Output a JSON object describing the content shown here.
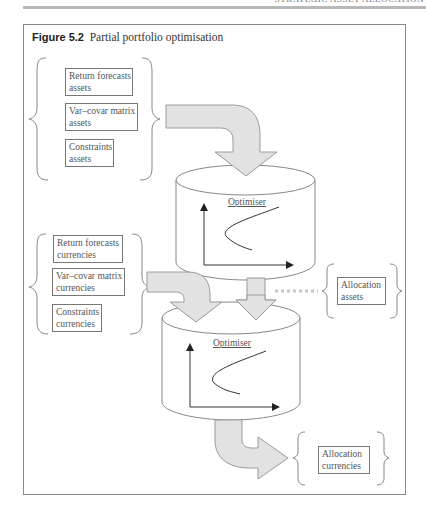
{
  "page": {
    "running_head": "STRATEGIC ASSET ALLOCATION"
  },
  "figure": {
    "number": "Figure 5.2",
    "title": "Partial portfolio optimisation"
  },
  "inputs_assets": [
    {
      "line1": "Return forecasts",
      "line2": "assets"
    },
    {
      "line1": "Var–covar matrix",
      "line2": "assets"
    },
    {
      "line1": "Constraints",
      "line2": "assets"
    }
  ],
  "inputs_currencies": [
    {
      "line1": "Return forecasts",
      "line2": "currencies"
    },
    {
      "line1": "Var–covar matrix",
      "line2": "currencies"
    },
    {
      "line1": "Constraints",
      "line2": "currencies"
    }
  ],
  "optimisers": [
    {
      "label": "Optimiser"
    },
    {
      "label": "Optimiser"
    }
  ],
  "outputs": {
    "allocation_assets": {
      "line1": "Allocation",
      "line2": "assets"
    },
    "allocation_currencies": {
      "line1": "Allocation",
      "line2": "currencies"
    }
  },
  "colors": {
    "arrow_fill": "#e2e2e2",
    "arrow_stroke": "#9a9a9a",
    "line": "#888888",
    "frame": "#8a8a8a",
    "dotted": "#c8c8c8"
  }
}
